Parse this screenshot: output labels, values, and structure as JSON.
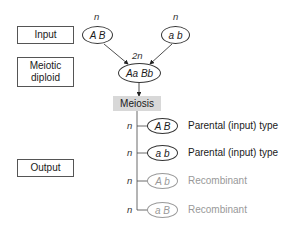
{
  "side_labels": {
    "input": "Input",
    "meiotic_diploid": "Meiotic diploid",
    "output": "Output"
  },
  "inputs": [
    {
      "ploidy": "n",
      "genotype": "A B"
    },
    {
      "ploidy": "n",
      "genotype": "a b"
    }
  ],
  "diploid": {
    "ploidy": "2n",
    "genotype": "Aa Bb"
  },
  "process": "Meiosis",
  "outputs": [
    {
      "ploidy": "n",
      "genotype": "A B",
      "type": "Parental (input) type"
    },
    {
      "ploidy": "n",
      "genotype": "a b",
      "type": "Parental (input) type"
    },
    {
      "ploidy": "n",
      "genotype": "A b",
      "type": "Recombinant"
    },
    {
      "ploidy": "n",
      "genotype": "a B",
      "type": "Recombinant"
    }
  ],
  "colors": {
    "parental": "#1a1a1a",
    "recombinant": "#999999",
    "meiosis_bg": "#d8d8d8"
  }
}
